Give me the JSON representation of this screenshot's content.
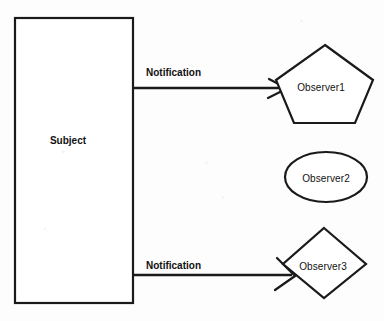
{
  "diagram": {
    "background_color": "#fdfdfd",
    "stroke_color": "#1a1a1a",
    "text_color": "#111111",
    "nodes": [
      {
        "id": "subject",
        "label": "Subject",
        "shape": "rectangle",
        "x": 15,
        "y": 18,
        "width": 118,
        "height": 285,
        "label_x": 68,
        "label_y": 140
      },
      {
        "id": "observer1",
        "label": "Observer1",
        "shape": "pentagon",
        "cx": 324,
        "cy": 86,
        "rx": 49,
        "ry": 42,
        "label_x": 321,
        "label_y": 87
      },
      {
        "id": "observer2",
        "label": "Observer2",
        "shape": "ellipse",
        "cx": 326,
        "cy": 177,
        "rx": 41,
        "ry": 25,
        "label_x": 326,
        "label_y": 178
      },
      {
        "id": "observer3",
        "label": "Observer3",
        "shape": "diamond",
        "cx": 324,
        "cy": 263,
        "rx": 42,
        "ry": 35,
        "label_x": 323,
        "label_y": 266
      }
    ],
    "edges": [
      {
        "id": "edge-subject-observer1",
        "label": "Notification",
        "from": "subject",
        "to": "observer1",
        "x1": 133,
        "y1": 88,
        "x2": 285,
        "y2": 88,
        "label_x": 146,
        "label_y": 72,
        "arrow_style": "open"
      },
      {
        "id": "edge-subject-observer3",
        "label": "Notification",
        "from": "subject",
        "to": "observer3",
        "x1": 133,
        "y1": 275,
        "x2": 293,
        "y2": 275,
        "label_x": 146,
        "label_y": 265,
        "arrow_style": "open"
      }
    ]
  }
}
